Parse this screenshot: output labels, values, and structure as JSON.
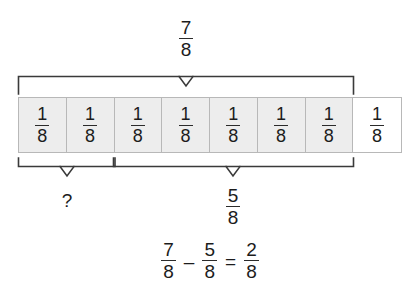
{
  "diagram": {
    "whole_label": {
      "numerator": "7",
      "denominator": "8"
    },
    "known_part_label": {
      "numerator": "5",
      "denominator": "8"
    },
    "unknown_part_label": "?",
    "bar": {
      "total_cells": 8,
      "shaded_cells": 7,
      "cell_value": {
        "numerator": "1",
        "denominator": "8"
      },
      "cells": [
        {
          "numerator": "1",
          "denominator": "8",
          "shaded": true
        },
        {
          "numerator": "1",
          "denominator": "8",
          "shaded": true
        },
        {
          "numerator": "1",
          "denominator": "8",
          "shaded": true
        },
        {
          "numerator": "1",
          "denominator": "8",
          "shaded": true
        },
        {
          "numerator": "1",
          "denominator": "8",
          "shaded": true
        },
        {
          "numerator": "1",
          "denominator": "8",
          "shaded": true
        },
        {
          "numerator": "1",
          "denominator": "8",
          "shaded": true
        },
        {
          "numerator": "1",
          "denominator": "8",
          "shaded": false
        }
      ]
    },
    "brackets": {
      "top": {
        "label": "7/8",
        "spans_cells": "1-7"
      },
      "bottom_left": {
        "label": "?",
        "spans_cells": "1-2"
      },
      "bottom_right": {
        "label": "5/8",
        "spans_cells": "3-7"
      }
    },
    "equation": {
      "minuend": {
        "numerator": "7",
        "denominator": "8"
      },
      "minus_sign": "–",
      "subtrahend": {
        "numerator": "5",
        "denominator": "8"
      },
      "equals_sign": "=",
      "difference": {
        "numerator": "2",
        "denominator": "8"
      }
    },
    "colors": {
      "shaded_fill": "#ededed",
      "unshaded_fill": "#ffffff",
      "cell_border": "#b8b8b8",
      "bracket_stroke": "#3a3a3a",
      "text": "#1c1c1c",
      "background": "#ffffff"
    }
  }
}
